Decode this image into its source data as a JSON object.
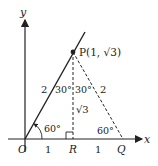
{
  "diagram": {
    "axes": {
      "x_label": "x",
      "y_label": "y"
    },
    "points": {
      "O": {
        "label": "O"
      },
      "R": {
        "label": "R"
      },
      "Q": {
        "label": "Q"
      },
      "P": {
        "label": "P(1, √3)"
      }
    },
    "segments": {
      "OP_length": "2",
      "PQ_length": "2",
      "OR_length": "1",
      "RQ_length": "1",
      "PR_length": "√3"
    },
    "angles": {
      "at_O": "60°",
      "at_Q": "60°",
      "at_P_left": "30°",
      "at_P_right": "30°"
    },
    "colors": {
      "ink": "#222222",
      "background": "#ffffff"
    }
  }
}
